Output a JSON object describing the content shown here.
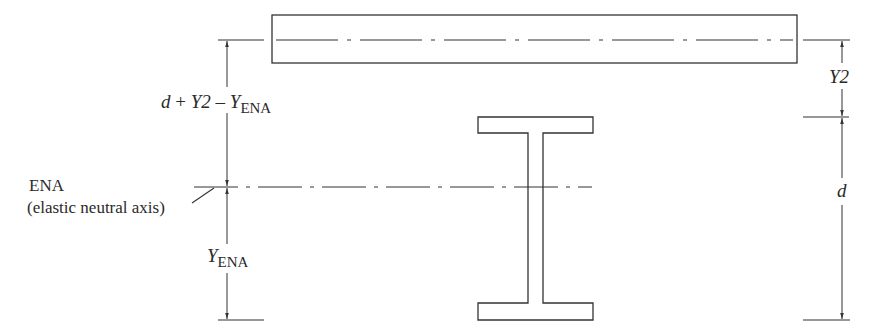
{
  "diagram": {
    "labels": {
      "top_dimension": {
        "d": "d",
        "plus": " + ",
        "y2": "Y2",
        "minus": " – ",
        "y": "Y",
        "sub": "ENA"
      },
      "ena_name": "ENA",
      "ena_desc": "(elastic neutral axis)",
      "y_ena": {
        "y": "Y",
        "sub": "ENA"
      },
      "y2": "Y2",
      "d": "d"
    },
    "colors": {
      "line": "#333333",
      "text": "#2a2a2a",
      "background": "#ffffff"
    }
  }
}
